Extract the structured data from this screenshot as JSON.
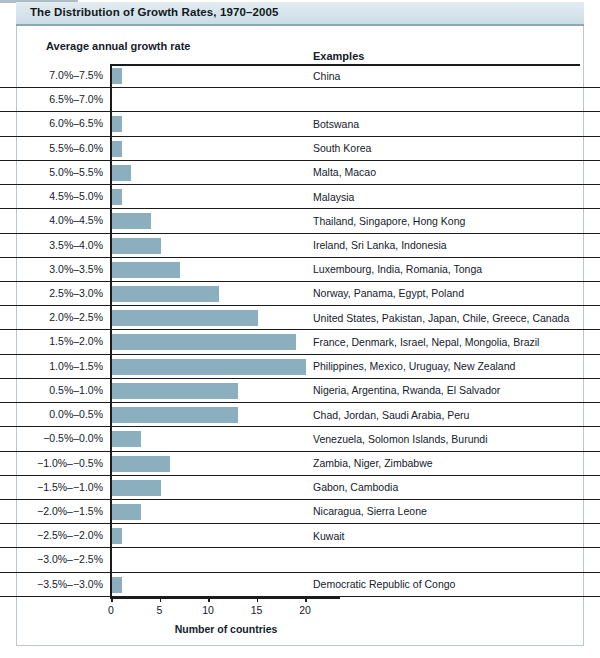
{
  "figure": {
    "title": "The Distribution of Growth Rates, 1970–2005",
    "growth_column_header": "Average annual growth rate",
    "examples_column_header": "Examples",
    "x_axis_title": "Number of countries",
    "bar_color": "#8cafc0",
    "title_band_color": "#d6e3ea",
    "axis_color": "#1b1b1b",
    "frame_color": "#b9c8cf"
  },
  "chart_data": {
    "type": "bar",
    "orientation": "horizontal",
    "title": "The Distribution of Growth Rates, 1970–2005",
    "xlabel": "Number of countries",
    "ylabel": "Average annual growth rate",
    "xlim": [
      0,
      23
    ],
    "xticks": [
      0,
      5,
      10,
      15,
      20
    ],
    "xtick_labels": [
      "0",
      "5",
      "10",
      "15",
      "20"
    ],
    "grid": false,
    "legend": false,
    "categories": [
      "7.0%–7.5%",
      "6.5%–7.0%",
      "6.0%–6.5%",
      "5.5%–6.0%",
      "5.0%–5.5%",
      "4.5%–5.0%",
      "4.0%–4.5%",
      "3.5%–4.0%",
      "3.0%–3.5%",
      "2.5%–3.0%",
      "2.0%–2.5%",
      "1.5%–2.0%",
      "1.0%–1.5%",
      "0.5%–1.0%",
      "0.0%–0.5%",
      "−0.5%–0.0%",
      "−1.0%–−0.5%",
      "−1.5%–−1.0%",
      "−2.0%–−1.5%",
      "−2.5%–−2.0%",
      "−3.0%–−2.5%",
      "−3.5%–−3.0%"
    ],
    "values": [
      1,
      0,
      1,
      1,
      2,
      1,
      4,
      5,
      7,
      11,
      15,
      19,
      20,
      13,
      13,
      3,
      6,
      5,
      3,
      1,
      0,
      1
    ],
    "annotations": [
      "China",
      "",
      "Botswana",
      "South Korea",
      "Malta, Macao",
      "Malaysia",
      "Thailand, Singapore, Hong Kong",
      "Ireland, Sri Lanka, Indonesia",
      "Luxembourg, India, Romania, Tonga",
      "Norway, Panama, Egypt, Poland",
      "United States, Pakistan, Japan, Chile, Greece, Canada",
      "France, Denmark, Israel, Nepal, Mongolia, Brazil",
      "Philippines, Mexico, Uruguay, New Zealand",
      "Nigeria, Argentina, Rwanda, El Salvador",
      "Chad, Jordan, Saudi Arabia, Peru",
      "Venezuela, Solomon Islands, Burundi",
      "Zambia, Niger, Zimbabwe",
      "Gabon, Cambodia",
      "Nicaragua, Sierra Leone",
      "Kuwait",
      "",
      "Democratic Republic of Congo"
    ]
  },
  "rows": [
    {
      "label": "7.0%–7.5%",
      "value": 1,
      "examples": "China"
    },
    {
      "label": "6.5%–7.0%",
      "value": 0,
      "examples": ""
    },
    {
      "label": "6.0%–6.5%",
      "value": 1,
      "examples": "Botswana"
    },
    {
      "label": "5.5%–6.0%",
      "value": 1,
      "examples": "South Korea"
    },
    {
      "label": "5.0%–5.5%",
      "value": 2,
      "examples": "Malta, Macao"
    },
    {
      "label": "4.5%–5.0%",
      "value": 1,
      "examples": "Malaysia"
    },
    {
      "label": "4.0%–4.5%",
      "value": 4,
      "examples": "Thailand, Singapore, Hong Kong"
    },
    {
      "label": "3.5%–4.0%",
      "value": 5,
      "examples": "Ireland, Sri Lanka, Indonesia"
    },
    {
      "label": "3.0%–3.5%",
      "value": 7,
      "examples": "Luxembourg, India, Romania, Tonga"
    },
    {
      "label": "2.5%–3.0%",
      "value": 11,
      "examples": "Norway, Panama, Egypt, Poland"
    },
    {
      "label": "2.0%–2.5%",
      "value": 15,
      "examples": "United States, Pakistan, Japan, Chile, Greece, Canada"
    },
    {
      "label": "1.5%–2.0%",
      "value": 19,
      "examples": "France, Denmark, Israel, Nepal, Mongolia, Brazil"
    },
    {
      "label": "1.0%–1.5%",
      "value": 20,
      "examples": "Philippines, Mexico, Uruguay, New Zealand"
    },
    {
      "label": "0.5%–1.0%",
      "value": 13,
      "examples": "Nigeria, Argentina, Rwanda, El Salvador"
    },
    {
      "label": "0.0%–0.5%",
      "value": 13,
      "examples": "Chad, Jordan, Saudi Arabia, Peru"
    },
    {
      "label": "−0.5%–0.0%",
      "value": 3,
      "examples": "Venezuela, Solomon Islands, Burundi"
    },
    {
      "label": "−1.0%–−0.5%",
      "value": 6,
      "examples": "Zambia, Niger, Zimbabwe"
    },
    {
      "label": "−1.5%–−1.0%",
      "value": 5,
      "examples": "Gabon, Cambodia"
    },
    {
      "label": "−2.0%–−1.5%",
      "value": 3,
      "examples": "Nicaragua, Sierra Leone"
    },
    {
      "label": "−2.5%–−2.0%",
      "value": 1,
      "examples": "Kuwait"
    },
    {
      "label": "−3.0%–−2.5%",
      "value": 0,
      "examples": ""
    },
    {
      "label": "−3.5%–−3.0%",
      "value": 1,
      "examples": "Democratic Republic of Congo"
    }
  ],
  "xticks": [
    {
      "value": 0,
      "label": "0"
    },
    {
      "value": 5,
      "label": "5"
    },
    {
      "value": 10,
      "label": "10"
    },
    {
      "value": 15,
      "label": "15"
    },
    {
      "value": 20,
      "label": "20"
    }
  ]
}
